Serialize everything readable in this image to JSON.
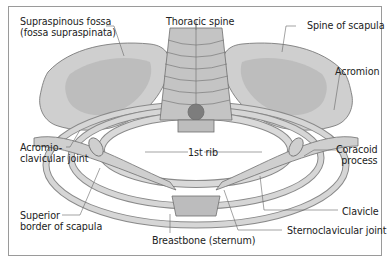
{
  "figure": {
    "labels": {
      "supraspinous_fossa": [
        "Supraspinous fossa",
        "(fossa supraspinata)"
      ],
      "thoracic_spine": "Thoracic spine",
      "spine_of_scapula": "Spine of scapula",
      "acromion": "Acromion",
      "acromioclavicular_joint": [
        "Acromio-",
        "clavicular joint"
      ],
      "first_rib": "1st rib",
      "coracoid_process": [
        "Coracoid",
        "process"
      ],
      "superior_border": [
        "Superior",
        "border of scapula"
      ],
      "clavicle": "Clavicle",
      "sternoclavicular_joint": "Sternoclavicular joint",
      "breastbone": "Breastbone (sternum)"
    },
    "colors": {
      "bone": "#cfcfcf",
      "bone_dark": "#a9a9a9",
      "outline": "#6e6e6e",
      "leader": "#666666",
      "frame": "#9a9a9a"
    }
  }
}
